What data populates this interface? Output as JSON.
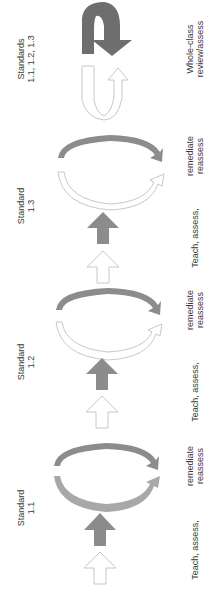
{
  "diagram": {
    "orientation": "rotated-90-ccw",
    "colors": {
      "filled_arrow": "#8c8c8c",
      "dark_arrow": "#6e6e6e",
      "hollow_outline": "#c8c8c8",
      "text": "#3a3a3a",
      "background": "#ffffff"
    },
    "stages": [
      {
        "standard_label": "Standard",
        "standard_number": "1.1",
        "action_label": "Teach, assess,",
        "cycle_label_1": "remediate",
        "cycle_label_2": "reassess"
      },
      {
        "standard_label": "Standard",
        "standard_number": "1.2",
        "action_label": "Teach, assess,",
        "cycle_label_1": "remediate",
        "cycle_label_2": "reassess"
      },
      {
        "standard_label": "Standard",
        "standard_number": "1.3",
        "action_label": "Teach, assess,",
        "cycle_label_1": "remediate",
        "cycle_label_2": "reassess"
      }
    ],
    "review": {
      "standards_label": "Standards",
      "standards_numbers": "1.1, 1.2, 1.3",
      "label_1": "Whole-class",
      "label_2": "review/assess"
    }
  }
}
